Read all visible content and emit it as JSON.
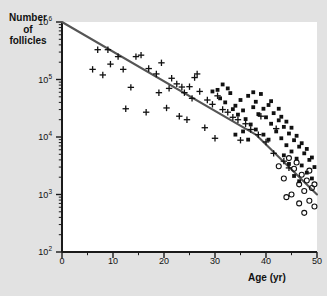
{
  "figure": {
    "background_color": "#e2e2e2",
    "plot_background_color": "#ffffff",
    "axis_color": "#1a1a1a",
    "line_color": "#555555",
    "marker_color": "#111111"
  },
  "axis": {
    "ylabel_line1": "Number",
    "ylabel_line2": "of",
    "ylabel_line3": "follicles",
    "xlabel": "Age (yr)",
    "ytick_labels": [
      "10",
      "10",
      "10",
      "10",
      "10"
    ],
    "ytick_exponents": [
      "6",
      "5",
      "4",
      "3",
      "2"
    ],
    "xtick_labels": [
      "0",
      "10",
      "20",
      "30",
      "40",
      "50"
    ]
  },
  "chart_data": {
    "type": "scatter",
    "title": "",
    "xlabel": "Age (yr)",
    "ylabel": "Number of follicles",
    "xlim": [
      0,
      50
    ],
    "ylim": [
      100,
      1000000
    ],
    "yscale": "log",
    "xscale": "linear",
    "grid": false,
    "legend": "none",
    "xticks": [
      0,
      10,
      20,
      30,
      40,
      50
    ],
    "yticks": [
      100,
      1000,
      10000,
      100000,
      1000000
    ],
    "series": [
      {
        "name": "plus-marker",
        "marker": "plus",
        "points": [
          [
            7.0,
            330000
          ],
          [
            9.0,
            330000
          ],
          [
            6.0,
            150000
          ],
          [
            8.0,
            120000
          ],
          [
            9.5,
            185000
          ],
          [
            12.0,
            150000
          ],
          [
            14.5,
            250000
          ],
          [
            15.5,
            265000
          ],
          [
            13.5,
            73000
          ],
          [
            17.0,
            155000
          ],
          [
            18.5,
            125000
          ],
          [
            19.0,
            59000
          ],
          [
            16.5,
            27000
          ],
          [
            20.5,
            32000
          ],
          [
            21.5,
            105000
          ],
          [
            22.5,
            84000
          ],
          [
            23.5,
            74000
          ],
          [
            21.0,
            70000
          ],
          [
            24.0,
            59000
          ],
          [
            25.0,
            75000
          ],
          [
            25.5,
            47000
          ],
          [
            26.0,
            108000
          ],
          [
            27.0,
            62000
          ],
          [
            23.0,
            23000
          ],
          [
            24.5,
            20000
          ],
          [
            28.5,
            44000
          ],
          [
            29.5,
            37000
          ],
          [
            30.5,
            52000
          ],
          [
            31.5,
            30000
          ],
          [
            28.0,
            14500
          ],
          [
            32.5,
            27000
          ],
          [
            33.5,
            22000
          ],
          [
            34.5,
            20000
          ],
          [
            30.0,
            9500
          ],
          [
            36.0,
            17000
          ],
          [
            37.0,
            13500
          ],
          [
            12.5,
            31000
          ],
          [
            35.0,
            8800
          ],
          [
            38.5,
            11000
          ],
          [
            40.0,
            8200
          ],
          [
            41.5,
            5200
          ],
          [
            43.5,
            3800
          ],
          [
            44.5,
            2900
          ],
          [
            42.0,
            14000
          ],
          [
            39.0,
            23000
          ],
          [
            26.5,
            125000
          ],
          [
            11.0,
            250000
          ],
          [
            19.5,
            195000
          ]
        ]
      },
      {
        "name": "filled-square-marker",
        "marker": "square",
        "points": [
          [
            30.5,
            66000
          ],
          [
            31.0,
            47000
          ],
          [
            32.0,
            40000
          ],
          [
            33.0,
            58000
          ],
          [
            34.0,
            35000
          ],
          [
            35.0,
            44000
          ],
          [
            35.5,
            29000
          ],
          [
            36.5,
            52000
          ],
          [
            37.5,
            33000
          ],
          [
            38.0,
            41000
          ],
          [
            38.5,
            25000
          ],
          [
            39.0,
            56000
          ],
          [
            39.5,
            31000
          ],
          [
            40.0,
            22000
          ],
          [
            40.5,
            36000
          ],
          [
            41.0,
            17000
          ],
          [
            41.5,
            26000
          ],
          [
            42.0,
            12500
          ],
          [
            42.5,
            19500
          ],
          [
            43.0,
            9500
          ],
          [
            43.5,
            15000
          ],
          [
            44.0,
            7200
          ],
          [
            44.5,
            11500
          ],
          [
            45.0,
            5600
          ],
          [
            45.5,
            8800
          ],
          [
            46.0,
            4200
          ],
          [
            46.5,
            6800
          ],
          [
            47.0,
            3200
          ],
          [
            47.5,
            5200
          ],
          [
            48.0,
            2400
          ],
          [
            48.5,
            4000
          ],
          [
            49.0,
            1900
          ],
          [
            49.5,
            3000
          ],
          [
            36.0,
            20500
          ],
          [
            37.0,
            16500
          ],
          [
            34.5,
            24500
          ],
          [
            33.5,
            30500
          ],
          [
            43.0,
            22500
          ],
          [
            44.0,
            18500
          ],
          [
            45.0,
            14500
          ],
          [
            46.0,
            10500
          ],
          [
            42.5,
            31000
          ],
          [
            41.0,
            42000
          ],
          [
            40.5,
            9000
          ],
          [
            39.5,
            11000
          ],
          [
            38.0,
            13500
          ],
          [
            47.0,
            7800
          ],
          [
            48.0,
            6200
          ],
          [
            45.5,
            2100
          ],
          [
            46.5,
            1700
          ],
          [
            44.5,
            3400
          ],
          [
            43.5,
            4800
          ],
          [
            49.0,
            4400
          ],
          [
            32.5,
            70000
          ],
          [
            31.5,
            82000
          ],
          [
            29.5,
            62000
          ],
          [
            37.5,
            60000
          ],
          [
            36.5,
            9000
          ],
          [
            35.5,
            12500
          ],
          [
            34.0,
            11000
          ]
        ]
      },
      {
        "name": "open-circle-marker",
        "marker": "circle",
        "points": [
          [
            44.5,
            4300
          ],
          [
            45.5,
            2800
          ],
          [
            46.0,
            3600
          ],
          [
            46.5,
            1500
          ],
          [
            47.0,
            2200
          ],
          [
            47.5,
            1150
          ],
          [
            48.0,
            1750
          ],
          [
            48.5,
            780
          ],
          [
            49.0,
            1300
          ],
          [
            49.5,
            620
          ],
          [
            45.0,
            1000
          ],
          [
            43.5,
            1900
          ],
          [
            47.5,
            480
          ],
          [
            48.5,
            2600
          ],
          [
            42.5,
            3100
          ],
          [
            49.5,
            1500
          ],
          [
            46.5,
            700
          ],
          [
            44.0,
            900
          ]
        ]
      }
    ],
    "fit_line": {
      "name": "biphasic-regression-line",
      "description": "Two-segment log-linear regression with breakpoint at age 38",
      "vertices": [
        [
          0,
          1000000
        ],
        [
          38,
          11000
        ],
        [
          50,
          1000
        ]
      ]
    }
  }
}
